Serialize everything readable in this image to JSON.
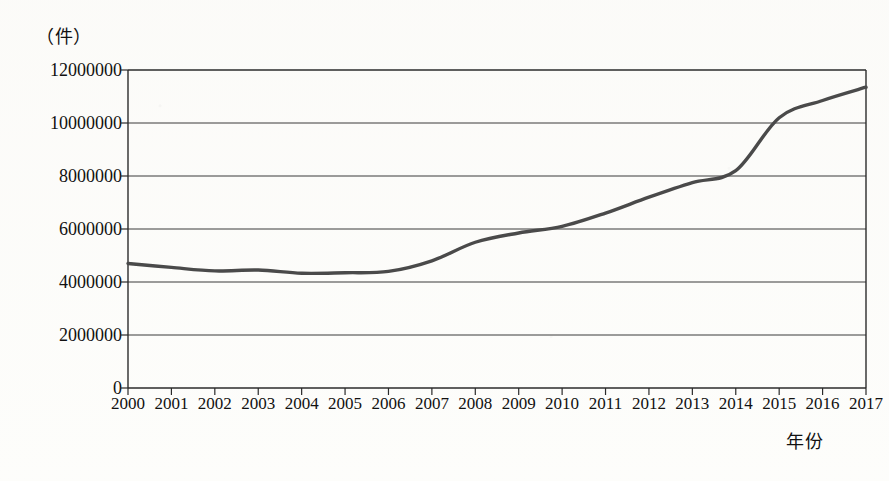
{
  "chart_data": {
    "type": "line",
    "title": "",
    "unit_caption": "（件）",
    "xlabel": "年份",
    "ylabel": "",
    "categories": [
      "2000",
      "2001",
      "2002",
      "2003",
      "2004",
      "2005",
      "2006",
      "2007",
      "2008",
      "2009",
      "2010",
      "2011",
      "2012",
      "2013",
      "2014",
      "2015",
      "2016",
      "2017"
    ],
    "x": [
      2000,
      2001,
      2002,
      2003,
      2004,
      2005,
      2006,
      2007,
      2008,
      2009,
      2010,
      2011,
      2012,
      2013,
      2014,
      2015,
      2016,
      2017
    ],
    "values": [
      4700000,
      4550000,
      4420000,
      4450000,
      4330000,
      4350000,
      4400000,
      4800000,
      5500000,
      5850000,
      6100000,
      6600000,
      7200000,
      7750000,
      8200000,
      10200000,
      10850000,
      11350000
    ],
    "series": [
      {
        "name": "",
        "values": [
          4700000,
          4550000,
          4420000,
          4450000,
          4330000,
          4350000,
          4400000,
          4800000,
          5500000,
          5850000,
          6100000,
          6600000,
          7200000,
          7750000,
          8200000,
          10200000,
          10850000,
          11350000
        ]
      }
    ],
    "ylim": [
      0,
      12000000
    ],
    "yticks": [
      0,
      2000000,
      4000000,
      6000000,
      8000000,
      10000000,
      12000000
    ],
    "ytick_labels": [
      "0",
      "2000000",
      "4000000",
      "6000000",
      "8000000",
      "10000000",
      "12000000"
    ],
    "grid": true,
    "grid_axis": "y",
    "legend": "none",
    "line_color": "#4a4a4a",
    "plot_border_color": "#2b2b2b",
    "background_color": "#fdfdfb"
  }
}
